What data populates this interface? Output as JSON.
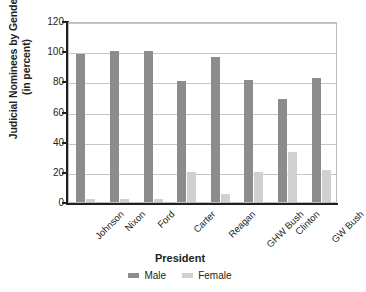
{
  "chart_data": {
    "type": "bar",
    "title": "",
    "xlabel": "President",
    "ylabel": "Judicial Nominees by Gender (in percent)",
    "ylabel_line1": "Judicial Nominees by Gender",
    "ylabel_line2": "(in percent)",
    "categories": [
      "Johnson",
      "Nixon",
      "Ford",
      "Carter",
      "Reagan",
      "GHW Bush",
      "Clinton",
      "GW Bush"
    ],
    "series": [
      {
        "name": "Male",
        "color": "#8c8c8c",
        "values": [
          98,
          100,
          100,
          80,
          96,
          81,
          68,
          82
        ]
      },
      {
        "name": "Female",
        "color": "#cfd0d1",
        "values": [
          2,
          2,
          2,
          20,
          5,
          20,
          33,
          21
        ]
      }
    ],
    "ylim": [
      0,
      120
    ],
    "yticks": [
      0,
      20,
      40,
      60,
      80,
      100,
      120
    ],
    "ytick_labels": [
      "0",
      "20",
      "40",
      "60",
      "80",
      "100",
      "120"
    ],
    "grid": true,
    "legend_position": "bottom"
  }
}
